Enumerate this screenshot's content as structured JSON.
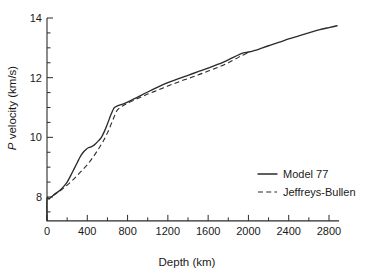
{
  "chart_data": {
    "type": "line",
    "title": "",
    "xlabel": "Depth (km)",
    "ylabel": "P velocity (km/s)",
    "ylabel_italic_prefix": "P",
    "ylabel_rest": " velocity (km/s)",
    "xlim": [
      0,
      2900
    ],
    "ylim": [
      7.2,
      14
    ],
    "xticks": [
      0,
      400,
      800,
      1200,
      1600,
      2000,
      2400,
      2800
    ],
    "xtick_labels": [
      "0",
      "400",
      "800",
      "1200",
      "1600",
      "2000",
      "2400",
      "2800"
    ],
    "xminor_step": 200,
    "yticks": [
      8,
      10,
      12,
      14
    ],
    "ytick_labels": [
      "8",
      "10",
      "12",
      "14"
    ],
    "yminor_step": 0.5,
    "grid": false,
    "legend_position": "lower-right",
    "series": [
      {
        "name": "Model 77",
        "style": "solid",
        "color": "#2b2b2b",
        "x": [
          0,
          0,
          20,
          35,
          60,
          90,
          120,
          160,
          200,
          240,
          270,
          300,
          330,
          360,
          390,
          410,
          430,
          450,
          480,
          510,
          540,
          570,
          600,
          630,
          650,
          660,
          670,
          690,
          720,
          760,
          800,
          900,
          1000,
          1100,
          1200,
          1300,
          1400,
          1500,
          1600,
          1700,
          1800,
          1900,
          1950,
          2000,
          2050,
          2100,
          2200,
          2300,
          2400,
          2500,
          2600,
          2700,
          2800,
          2880
        ],
        "y": [
          7.2,
          7.93,
          7.93,
          7.98,
          8.05,
          8.13,
          8.2,
          8.33,
          8.5,
          8.75,
          8.95,
          9.15,
          9.35,
          9.5,
          9.6,
          9.65,
          9.67,
          9.7,
          9.78,
          9.88,
          10.0,
          10.2,
          10.45,
          10.72,
          10.88,
          10.95,
          11.0,
          11.04,
          11.08,
          11.12,
          11.18,
          11.35,
          11.52,
          11.68,
          11.83,
          11.96,
          12.08,
          12.2,
          12.32,
          12.45,
          12.6,
          12.76,
          12.83,
          12.86,
          12.9,
          12.95,
          13.07,
          13.18,
          13.3,
          13.4,
          13.5,
          13.6,
          13.68,
          13.74
        ]
      },
      {
        "name": "Jeffreys-Bullen",
        "style": "dashed",
        "color": "#2b2b2b",
        "x": [
          60,
          100,
          150,
          200,
          250,
          300,
          350,
          400,
          450,
          500,
          550,
          600,
          650,
          680,
          700,
          750,
          800,
          900,
          1000,
          1100,
          1200,
          1300,
          1400,
          1500,
          1600,
          1700,
          1800,
          1900,
          1950,
          2000
        ],
        "y": [
          8.05,
          8.14,
          8.26,
          8.4,
          8.55,
          8.72,
          8.9,
          9.08,
          9.3,
          9.55,
          9.82,
          10.15,
          10.55,
          10.8,
          10.92,
          11.05,
          11.14,
          11.3,
          11.45,
          11.58,
          11.72,
          11.85,
          11.97,
          12.09,
          12.22,
          12.35,
          12.5,
          12.68,
          12.76,
          12.84
        ]
      }
    ],
    "legend": [
      {
        "label": "Model 77",
        "style": "solid"
      },
      {
        "label": "Jeffreys-Bullen",
        "style": "dashed"
      }
    ]
  }
}
